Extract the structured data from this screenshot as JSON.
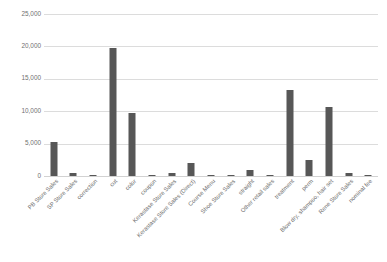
{
  "chart_data": {
    "type": "bar",
    "title": "",
    "subtitle": "",
    "xlabel": "",
    "ylabel": "",
    "ylim": [
      0,
      25000
    ],
    "grid": true,
    "legend": false,
    "legend_position": "none",
    "bar_color": "#575757",
    "gridline_color": "#dcdcdc",
    "y_ticks": [
      "0",
      "5,000",
      "10,000",
      "15,000",
      "20,000",
      "25,000"
    ],
    "y_tick_values": [
      0,
      5000,
      10000,
      15000,
      20000,
      25000
    ],
    "categories": [
      "PB Store Sales",
      "SP Store Sales",
      "correction",
      "cut",
      "color",
      "coupon",
      "Kerastase Store Sales",
      "Kerastase Store Sales (Direct)",
      "Course Menu",
      "Shoe Store Sales",
      "straight",
      "Other retail sales",
      "treatment",
      "perm",
      "Blow dry, shampoo, hair set",
      "Rene Store Sales",
      "nominal fee"
    ],
    "values": [
      5300,
      400,
      30,
      19700,
      9700,
      180,
      400,
      2050,
      20,
      20,
      1000,
      120,
      13300,
      2400,
      10600,
      500,
      20
    ]
  }
}
